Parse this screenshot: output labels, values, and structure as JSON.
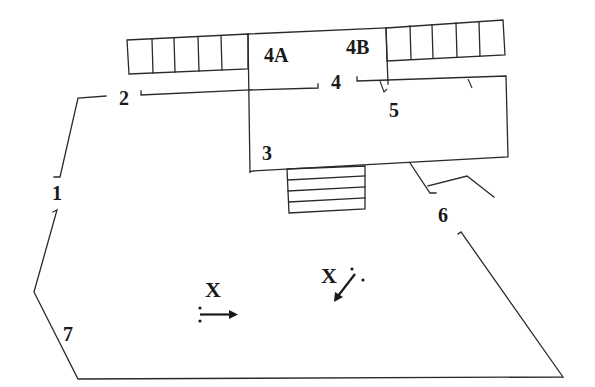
{
  "diagram": {
    "background": "#ffffff",
    "line_color": "#2a2a2a",
    "labels": {
      "l1": "1",
      "l2": "2",
      "l3": "3",
      "l4": "4",
      "l4a": "4A",
      "l4b": "4B",
      "l5": "5",
      "l6": "6",
      "l7": "7",
      "x_left": "X",
      "x_right": "X"
    },
    "components": {
      "left_seating_block": {
        "cells": 5,
        "description": "row of 5 rectangular cells, upper left"
      },
      "right_seating_block": {
        "cells": 5,
        "description": "row of 5 rectangular cells, upper right"
      },
      "stage_4a_4b": {
        "description": "upper central box containing 4A and 4B"
      },
      "stage_3_5": {
        "description": "main rectangular platform labelled 3 and 5"
      },
      "steps": {
        "count": 4,
        "description": "stairs below main platform"
      },
      "perimeter": {
        "description": "outer boundary with gaps at 1, 2, 6"
      },
      "marker_left": {
        "symbol": "X",
        "arrow": "right",
        "description": "X with dotted arrow pointing right"
      },
      "marker_right": {
        "symbol": "X",
        "arrow": "down-left",
        "description": "X with dotted arrow pointing down-left"
      }
    }
  }
}
